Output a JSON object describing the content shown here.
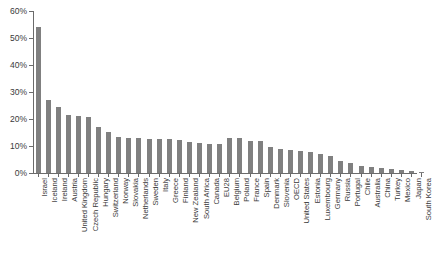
{
  "chart_data": {
    "type": "bar",
    "title": "",
    "xlabel": "",
    "ylabel": "",
    "ylim": [
      0,
      60
    ],
    "ytick_values": [
      0,
      10,
      20,
      30,
      40,
      50,
      60
    ],
    "ytick_labels": [
      "0%",
      "10%",
      "20%",
      "30%",
      "40%",
      "50%",
      "60%"
    ],
    "grid": false,
    "legend": "none",
    "bar_color": "#808080",
    "axis_color": "#6b6b6b",
    "categories": [
      "Israel",
      "Iceland",
      "Ireland",
      "Austria",
      "United Kingdom",
      "Czech Republic",
      "Hungary",
      "Switzerland",
      "Norway",
      "Slovakia",
      "Netherlands",
      "Sweden",
      "Italy",
      "Greece",
      "Finland",
      "New Zealand",
      "South Africa",
      "Canada",
      "EU28",
      "Belgium",
      "Poland",
      "France",
      "Spain",
      "Denmark",
      "Slovenia",
      "OECD",
      "United States",
      "Estonia",
      "Luxembourg",
      "Germany",
      "Russia",
      "Portugal",
      "Chile",
      "Australia",
      "China",
      "Turkey",
      "Mexico",
      "Japan",
      "South Korea"
    ],
    "values": [
      54.0,
      27.2,
      24.6,
      21.4,
      21.0,
      20.9,
      17.0,
      15.1,
      13.2,
      13.1,
      12.9,
      12.6,
      12.6,
      12.5,
      12.4,
      11.4,
      11.1,
      10.9,
      10.6,
      13.0,
      12.9,
      12.0,
      11.9,
      9.6,
      9.0,
      8.6,
      8.2,
      7.6,
      7.0,
      6.2,
      4.6,
      3.6,
      2.6,
      2.4,
      2.0,
      1.6,
      1.2,
      0.9,
      0.5
    ],
    "value_unit": "%"
  },
  "caption": {
    "text": ""
  }
}
